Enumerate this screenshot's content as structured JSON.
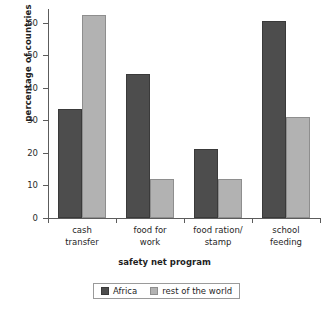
{
  "chart_data": {
    "type": "bar",
    "title": "",
    "xlabel": "safety net program",
    "ylabel": "percentage of countries",
    "categories": [
      "cash transfer",
      "food for work",
      "food ration/ stamp",
      "school feeding"
    ],
    "category_lines": [
      [
        "cash",
        "transfer"
      ],
      [
        "food for",
        "work"
      ],
      [
        "food ration/",
        "stamp"
      ],
      [
        "school",
        "feeding"
      ]
    ],
    "series": [
      {
        "name": "Africa",
        "color": "#4d4d4d",
        "values": [
          34.2,
          45.0,
          21.6,
          61.5
        ]
      },
      {
        "name": "rest of the world",
        "color": "#b2b2b2",
        "values": [
          63.4,
          12.3,
          12.1,
          31.7
        ]
      }
    ],
    "ylim": [
      0,
      65
    ],
    "yticks": [
      0,
      10,
      20,
      30,
      40,
      50,
      60
    ],
    "ytick_labels": [
      "0",
      "10",
      "20",
      "30",
      "40",
      "50",
      "60"
    ],
    "grid": false,
    "legend_position": "below-axes",
    "legend_entries": [
      "Africa",
      "rest of the world"
    ]
  },
  "ytick_labels": {
    "t0": "0",
    "t10": "10",
    "t20": "20",
    "t30": "30",
    "t40": "40",
    "t50": "50",
    "t60": "60"
  },
  "axis_titles": {
    "x": "safety net program",
    "y": "percentage of countries"
  },
  "groups": {
    "g0_line1": "cash",
    "g0_line2": "transfer",
    "g1_line1": "food for",
    "g1_line2": "work",
    "g2_line1": "food ration/",
    "g2_line2": "stamp",
    "g3_line1": "school",
    "g3_line2": "feeding"
  },
  "legend": {
    "africa_label": "Africa",
    "world_label": "rest of the world"
  }
}
